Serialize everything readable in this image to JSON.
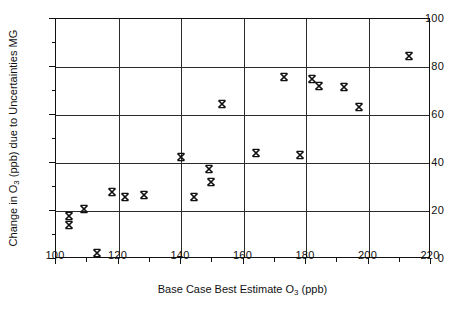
{
  "chart_data": {
    "type": "scatter",
    "title": "",
    "xlabel_plain": "Base Case Best Estimate O3 (ppb)",
    "ylabel_plain": "Change in O3 (ppb) due to Uncertainties MG",
    "xlabel_prefix": "Base Case Best Estimate O",
    "xlabel_sub": "3",
    "xlabel_suffix": " (ppb)",
    "ylabel_prefix": "Change in O",
    "ylabel_sub": "3",
    "ylabel_suffix": " (ppb) due to Uncertainties MG",
    "xlim": [
      100,
      220
    ],
    "ylim": [
      0,
      100
    ],
    "x_major_ticks": [
      100,
      120,
      140,
      160,
      180,
      200,
      220
    ],
    "x_minor_ticks": [
      110,
      130,
      150,
      170,
      190,
      210
    ],
    "y_major_ticks": [
      0,
      20,
      40,
      60,
      80,
      100
    ],
    "y_minor_ticks": [
      10,
      30,
      50,
      70,
      90
    ],
    "x_tick_labels": [
      "100",
      "120",
      "140",
      "160",
      "180",
      "200",
      "220"
    ],
    "y_tick_labels": [
      "0",
      "20",
      "40",
      "60",
      "80",
      "100"
    ],
    "grid": "major gridlines on both axes",
    "legend": "none",
    "marker_style": "bold-x",
    "marker_color": "#111111",
    "series": [
      {
        "name": "MG uncertainty",
        "points": [
          {
            "x": 104,
            "y": 18
          },
          {
            "x": 104,
            "y": 14
          },
          {
            "x": 109,
            "y": 21
          },
          {
            "x": 113,
            "y": 2.5
          },
          {
            "x": 118,
            "y": 28
          },
          {
            "x": 122,
            "y": 26
          },
          {
            "x": 128,
            "y": 26.5
          },
          {
            "x": 140,
            "y": 42.5
          },
          {
            "x": 144,
            "y": 26
          },
          {
            "x": 149,
            "y": 37.5
          },
          {
            "x": 149.5,
            "y": 32
          },
          {
            "x": 153,
            "y": 64.5
          },
          {
            "x": 164,
            "y": 44
          },
          {
            "x": 173,
            "y": 76
          },
          {
            "x": 178,
            "y": 43.5
          },
          {
            "x": 182,
            "y": 75
          },
          {
            "x": 184,
            "y": 72
          },
          {
            "x": 192,
            "y": 71.5
          },
          {
            "x": 197,
            "y": 63.5
          },
          {
            "x": 213,
            "y": 84.5
          }
        ]
      }
    ]
  }
}
